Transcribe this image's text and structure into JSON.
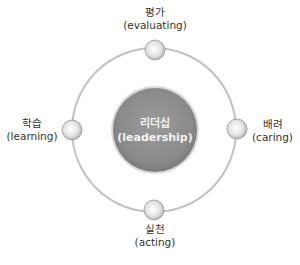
{
  "center": {
    "ko": "리더십",
    "en": "(leadership)"
  },
  "nodes": [
    {
      "id": "top",
      "ko": "평가",
      "en": "(evaluating)"
    },
    {
      "id": "right",
      "ko": "배려",
      "en": "(caring)"
    },
    {
      "id": "bottom",
      "ko": "실천",
      "en": "(acting)"
    },
    {
      "id": "left",
      "ko": "학습",
      "en": "(learning)"
    }
  ],
  "colors": {
    "ring": "#bdbdbd",
    "center_fill": "#8e8e8e",
    "node_fill": "#e6e6e6",
    "text": "#333333"
  }
}
